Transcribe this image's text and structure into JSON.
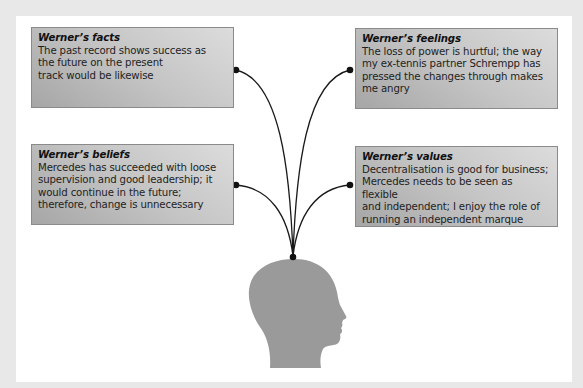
{
  "diagram": {
    "boxes": [
      {
        "id": "facts",
        "title": "Werner’s facts",
        "body": "The past record shows success as\nthe future on the present\ntrack would be likewise"
      },
      {
        "id": "feelings",
        "title": "Werner’s feelings",
        "body": "The loss of power is hurtful; the way\nmy ex-tennis partner Schrempp has\npressed the changes through makes\nme angry"
      },
      {
        "id": "beliefs",
        "title": "Werner’s beliefs",
        "body": "Mercedes has succeeded with loose\nsupervision and good leadership; it\nwould continue in the future;\ntherefore, change is unnecessary"
      },
      {
        "id": "values",
        "title": "Werner’s values",
        "body": "Decentralisation is good for business;\nMercedes needs to be seen as flexible\nand independent; I enjoy the role of\nrunning an independent marque"
      }
    ],
    "center_icon": "head-silhouette-icon",
    "colors": {
      "background": "#e8e8e8",
      "panel": "#ffffff",
      "box_dark": "#a6a6a6",
      "box_light": "#dcdcdc",
      "connector": "#1a1a1a",
      "head": "#9a9a9a"
    }
  }
}
